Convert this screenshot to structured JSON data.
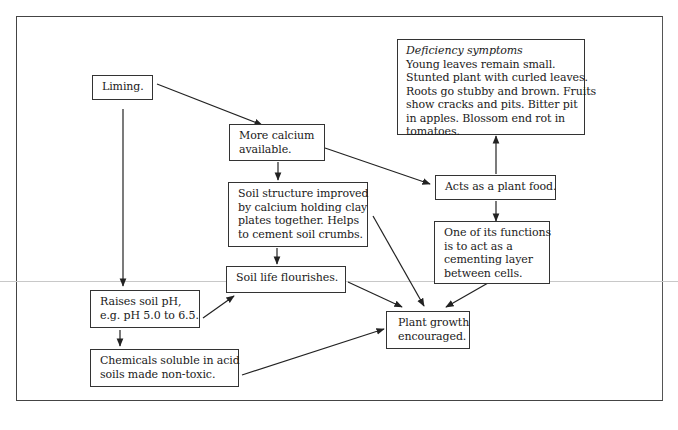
{
  "diagram": {
    "nodes": {
      "liming": {
        "lines": [
          "Liming."
        ]
      },
      "more_calcium": {
        "lines": [
          "More calcium",
          "available."
        ]
      },
      "soil_structure": {
        "lines": [
          "Soil structure improved",
          "by calcium holding clay",
          "plates together. Helps",
          "to cement soil crumbs."
        ]
      },
      "soil_life": {
        "lines": [
          "Soil life flourishes."
        ]
      },
      "raises_ph": {
        "lines": [
          "Raises soil pH,",
          "e.g. pH 5.0 to 6.5."
        ]
      },
      "chemicals": {
        "lines": [
          "Chemicals soluble in acid",
          "soils made non-toxic."
        ]
      },
      "plant_growth": {
        "lines": [
          "Plant growth",
          "encouraged."
        ]
      },
      "plant_food": {
        "lines": [
          "Acts as a plant food."
        ]
      },
      "cementing": {
        "lines": [
          "One of its functions",
          "is to act as a",
          "cementing layer",
          "between cells."
        ]
      },
      "deficiency": {
        "title": "Deficiency symptoms",
        "lines": [
          "Young leaves remain small.",
          "Stunted plant with curled leaves.",
          "Roots go stubby and brown. Fruits",
          "show cracks and pits. Bitter pit",
          "in apples. Blossom end rot in",
          "tomatoes."
        ]
      }
    },
    "edges": [
      {
        "from": "liming",
        "to": "more_calcium"
      },
      {
        "from": "liming",
        "to": "raises_ph"
      },
      {
        "from": "more_calcium",
        "to": "soil_structure"
      },
      {
        "from": "more_calcium",
        "to": "plant_food"
      },
      {
        "from": "soil_structure",
        "to": "soil_life"
      },
      {
        "from": "soil_structure",
        "to": "plant_growth"
      },
      {
        "from": "plant_food",
        "to": "deficiency"
      },
      {
        "from": "plant_food",
        "to": "cementing"
      },
      {
        "from": "cementing",
        "to": "plant_growth"
      },
      {
        "from": "soil_life",
        "to": "plant_growth"
      },
      {
        "from": "raises_ph",
        "to": "soil_life"
      },
      {
        "from": "raises_ph",
        "to": "chemicals"
      },
      {
        "from": "chemicals",
        "to": "plant_growth"
      }
    ],
    "colors": {
      "stroke": "#222222",
      "frame": "#444444",
      "rule": "#c8c8c8",
      "background": "#ffffff"
    }
  }
}
